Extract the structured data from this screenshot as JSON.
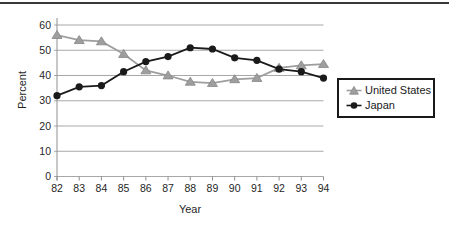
{
  "chart_data": {
    "type": "line",
    "title": "",
    "xlabel": "Year",
    "ylabel": "Percent",
    "x_categories": [
      "82",
      "83",
      "84",
      "85",
      "86",
      "87",
      "88",
      "89",
      "90",
      "91",
      "92",
      "93",
      "94"
    ],
    "ylim": [
      0,
      60
    ],
    "ytick_values": [
      0,
      10,
      20,
      30,
      40,
      50,
      60
    ],
    "grid": "horizontal-gridlines",
    "legend_position": "right-middle-boxed",
    "series": [
      {
        "name": "United States",
        "marker": "triangle",
        "color": "#9e9e9e",
        "marker_edge_color": "#868686",
        "values": [
          56,
          54,
          53.5,
          48.5,
          42,
          40,
          37.5,
          37,
          38.5,
          39,
          43,
          44,
          44.5
        ]
      },
      {
        "name": "Japan",
        "marker": "circle",
        "color": "#1a1a1a",
        "marker_edge_color": "#000000",
        "values": [
          32,
          35.5,
          36,
          41.5,
          45.5,
          47.5,
          51,
          50.5,
          47,
          46,
          42.5,
          41.5,
          39
        ]
      }
    ],
    "colors": {
      "background": "#ffffff",
      "gridline": "#a8a8a8",
      "axis": "#8f8f8f",
      "tick_text": "#1f1f1f",
      "top_rule": "#383838",
      "legend_border": "#191919"
    }
  }
}
